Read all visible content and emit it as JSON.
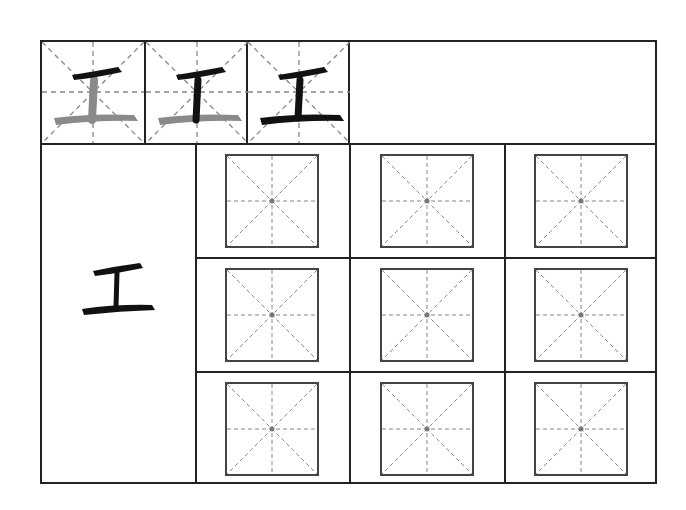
{
  "worksheet": {
    "character": "工",
    "stroke_order_steps": [
      {
        "step": 1,
        "label": "Stroke 1 of 3",
        "strokes_done": 1
      },
      {
        "step": 2,
        "label": "Stroke 2 of 3",
        "strokes_done": 2
      },
      {
        "step": 3,
        "label": "Stroke 3 of 3",
        "strokes_done": 3
      }
    ],
    "model_character": "工",
    "practice_grid": {
      "rows": 3,
      "cols": 3,
      "guide": "mi-zi-ge"
    },
    "colors": {
      "ink": "#111111",
      "pending_stroke": "#8a8a8a",
      "grid_line": "#222222",
      "guide_line": "#888888"
    }
  }
}
